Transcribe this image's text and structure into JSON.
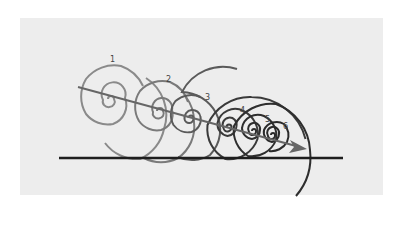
{
  "figure": {
    "labels": [
      "1",
      "2",
      "3",
      "4",
      "5",
      "6"
    ],
    "colors": {
      "background": "#ffffff",
      "panel": "#ededed",
      "baseline": "#1e1e1e",
      "arrow": "#666666",
      "spiral_light": "#8a8a8a",
      "spiral_mid": "#5a5a5a",
      "spiral_dark": "#2a2a2a"
    }
  }
}
